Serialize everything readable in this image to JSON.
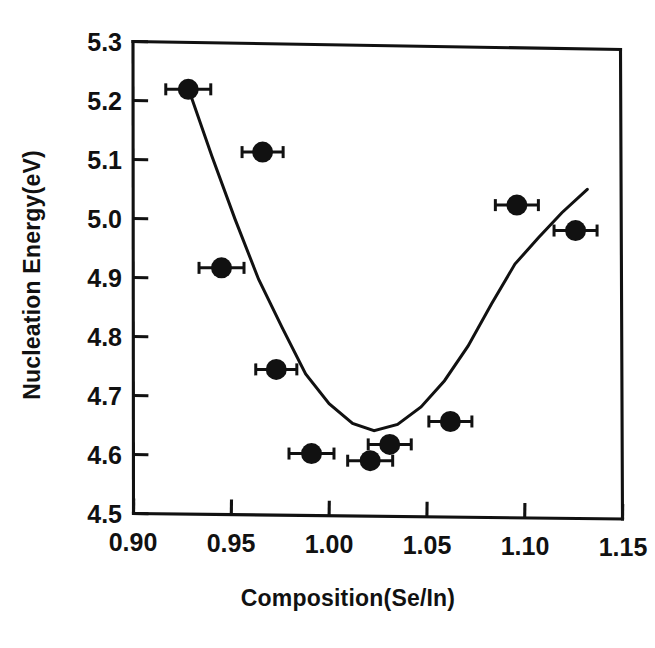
{
  "chart_data": {
    "type": "scatter",
    "title": "",
    "xlabel": "Composition(Se/In)",
    "ylabel": "Nucleation Energy(eV)",
    "xlim": [
      0.9,
      1.15
    ],
    "ylim": [
      4.5,
      5.3
    ],
    "xticks": [
      "0.90",
      "0.95",
      "1.00",
      "1.05",
      "1.10",
      "1.15"
    ],
    "xtick_values": [
      0.9,
      0.95,
      1.0,
      1.05,
      1.1,
      1.15
    ],
    "yticks": [
      "4.5",
      "4.6",
      "4.7",
      "4.8",
      "4.9",
      "5.0",
      "5.1",
      "5.2",
      "5.3"
    ],
    "ytick_values": [
      4.5,
      4.6,
      4.7,
      4.8,
      4.9,
      5.0,
      5.1,
      5.2,
      5.3
    ],
    "grid": false,
    "legend": null,
    "marker_style": "filled-circle",
    "error_bars": "x-direction",
    "series": [
      {
        "name": "Nucleation energy measurements",
        "x": [
          0.928,
          0.945,
          0.966,
          0.973,
          0.991,
          1.021,
          1.031,
          1.062,
          1.096,
          1.126
        ],
        "y": [
          5.22,
          4.918,
          5.115,
          4.747,
          4.605,
          4.594,
          4.622,
          4.662,
          5.03,
          4.988
        ],
        "xerr": [
          0.0115,
          0.0115,
          0.0105,
          0.0105,
          0.0115,
          0.0115,
          0.011,
          0.011,
          0.011,
          0.011
        ],
        "yerr": [
          0.0,
          0.0,
          0.0,
          0.0,
          0.012,
          0.0,
          0.0,
          0.0,
          0.0,
          0.0
        ]
      }
    ],
    "fit_curve": {
      "name": "Parabolic fit",
      "minimum_x": 1.023,
      "minimum_y": 4.645,
      "x_start": 0.928,
      "x_end": 1.132,
      "y_start": 5.222,
      "y_end": 5.058,
      "points_x": [
        0.928,
        0.94,
        0.952,
        0.964,
        0.976,
        0.988,
        1.0,
        1.012,
        1.023,
        1.035,
        1.047,
        1.059,
        1.071,
        1.083,
        1.095,
        1.107,
        1.119,
        1.132
      ],
      "points_y": [
        5.222,
        5.108,
        5.0,
        4.899,
        4.818,
        4.74,
        4.69,
        4.657,
        4.645,
        4.656,
        4.686,
        4.731,
        4.79,
        4.862,
        4.93,
        4.975,
        5.018,
        5.058
      ]
    }
  },
  "axes": {
    "x_title": "Composition(Se/In)",
    "y_title": "Nucleation Energy(eV)"
  }
}
